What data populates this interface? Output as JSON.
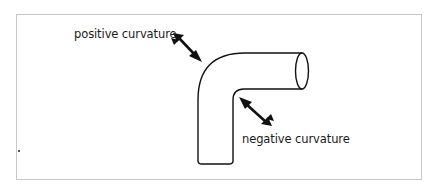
{
  "diagram": {
    "labels": {
      "positive": "positive curvature",
      "negative": "negative curvature"
    },
    "colors": {
      "stroke": "#111111",
      "frame": "#c8c8c8",
      "background": "#ffffff"
    },
    "elements": [
      {
        "id": "pipe",
        "type": "bent-cylinder"
      },
      {
        "id": "arrow-positive",
        "type": "double-arrow",
        "points_to": "outer bend"
      },
      {
        "id": "arrow-negative",
        "type": "double-arrow",
        "points_to": "inner bend"
      }
    ]
  }
}
